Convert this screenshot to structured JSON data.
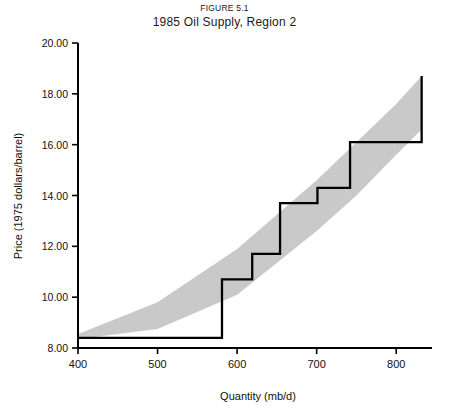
{
  "figure": {
    "number": "FIGURE 5.1",
    "title": "1985 Oil Supply, Region 2"
  },
  "chart_data": {
    "type": "line",
    "title": "1985 Oil Supply, Region 2",
    "subtitle": "FIGURE 5.1",
    "xlabel": "Quantity (mb/d)",
    "ylabel": "Price (1975 dollars/barrel)",
    "xlim": [
      400,
      845
    ],
    "ylim": [
      8.0,
      20.0
    ],
    "grid": false,
    "legend": null,
    "xticks": [
      400,
      500,
      600,
      700,
      800
    ],
    "xtick_labels": [
      "400",
      "500",
      "600",
      "700",
      "800"
    ],
    "yticks": [
      8.0,
      10.0,
      12.0,
      14.0,
      16.0,
      18.0,
      20.0
    ],
    "ytick_labels": [
      "8.00",
      "10.00",
      "12.00",
      "14.00",
      "16.00",
      "18.00",
      "20.00"
    ],
    "series": [
      {
        "name": "Supply curve (step function)",
        "style": "step-post",
        "color": "#000000",
        "x": [
          400,
          581,
          581,
          619,
          619,
          654,
          654,
          701,
          701,
          742,
          742,
          832,
          832
        ],
        "y": [
          8.4,
          8.4,
          10.7,
          10.7,
          11.7,
          11.7,
          13.7,
          13.7,
          14.3,
          14.3,
          16.1,
          16.1,
          18.7
        ],
        "steps": [
          {
            "quantity_start": 400,
            "quantity_end": 581,
            "price": 8.4
          },
          {
            "quantity_start": 581,
            "quantity_end": 619,
            "price": 10.7
          },
          {
            "quantity_start": 619,
            "quantity_end": 654,
            "price": 11.7
          },
          {
            "quantity_start": 654,
            "quantity_end": 701,
            "price": 13.7
          },
          {
            "quantity_start": 701,
            "quantity_end": 742,
            "price": 14.3
          },
          {
            "quantity_start": 742,
            "quantity_end": 832,
            "price": 16.1
          },
          {
            "quantity_start": 832,
            "quantity_end": 832,
            "price": 18.7
          }
        ]
      },
      {
        "name": "Uncertainty band (upper bound)",
        "style": "band-edge",
        "color": "#b3b3b3",
        "x": [
          400,
          500,
          600,
          700,
          750,
          800,
          832
        ],
        "y": [
          8.55,
          9.8,
          11.9,
          14.6,
          16.1,
          17.6,
          18.7
        ]
      },
      {
        "name": "Uncertainty band (lower bound)",
        "style": "band-edge",
        "color": "#b3b3b3",
        "x": [
          400,
          500,
          600,
          700,
          750,
          800,
          832
        ],
        "y": [
          8.35,
          8.75,
          10.1,
          12.6,
          14.0,
          15.6,
          16.6
        ]
      }
    ],
    "band_fill": "#c9c9c9",
    "annotations": []
  }
}
